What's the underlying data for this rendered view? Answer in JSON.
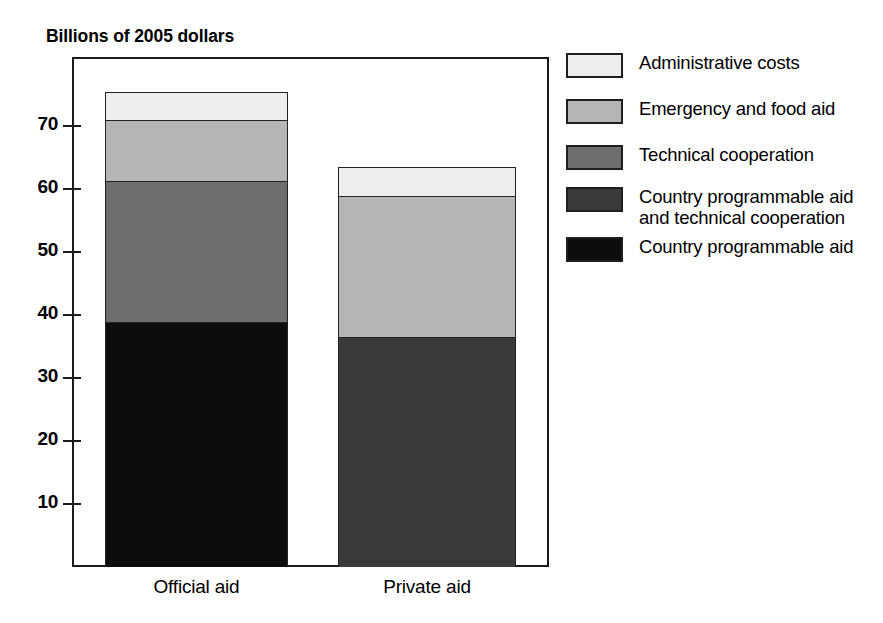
{
  "chart_data": {
    "type": "bar",
    "subtype": "stacked-bar",
    "title": "",
    "ylabel": "Billions of 2005 dollars",
    "xlabel": "",
    "categories": [
      "Official aid",
      "Private aid"
    ],
    "ylim": [
      0,
      78
    ],
    "yticks": [
      10,
      20,
      30,
      40,
      50,
      60,
      70
    ],
    "ytick_labels": [
      "10",
      "20",
      "30",
      "40",
      "50",
      "60",
      "70"
    ],
    "grid": false,
    "legend_position": "right",
    "series": [
      {
        "name": "Country programmable aid",
        "color": "#0d0d0d",
        "values": [
          38.9,
          0
        ]
      },
      {
        "name": "Country programmable aid\nand technical cooperation",
        "color": "#3a3a3a",
        "values": [
          0,
          36.5
        ]
      },
      {
        "name": "Technical cooperation",
        "color": "#6e6e6e",
        "values": [
          22.4,
          0
        ]
      },
      {
        "name": "Emergency and food aid",
        "color": "#b5b5b5",
        "values": [
          9.6,
          22.4
        ]
      },
      {
        "name": "Administrative costs",
        "color": "#ededed",
        "values": [
          4.5,
          4.6
        ]
      }
    ],
    "totals": [
      75.4,
      63.5
    ]
  },
  "legend": {
    "items": [
      {
        "label": "Administrative costs",
        "color": "#ededed"
      },
      {
        "label": "Emergency and food aid",
        "color": "#b5b5b5"
      },
      {
        "label": "Technical cooperation",
        "color": "#6e6e6e"
      },
      {
        "label": "Country programmable aid\nand technical cooperation",
        "color": "#3a3a3a"
      },
      {
        "label": "Country programmable aid",
        "color": "#0d0d0d"
      }
    ]
  },
  "axis": {
    "title": "Billions of 2005 dollars",
    "ticks": [
      "70",
      "60",
      "50",
      "40",
      "30",
      "20",
      "10"
    ],
    "x_categories": [
      "Official aid",
      "Private aid"
    ]
  },
  "colors": {
    "frame": "#1a1a1a",
    "background": "#ffffff",
    "administrative_costs": "#ededed",
    "emergency_and_food_aid": "#b5b5b5",
    "technical_cooperation": "#6e6e6e",
    "cpa_and_technical_cooperation": "#3a3a3a",
    "country_programmable_aid": "#0d0d0d"
  }
}
